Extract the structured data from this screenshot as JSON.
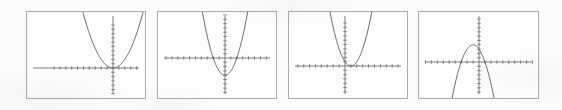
{
  "figure": {
    "caption": "",
    "background_color": "#fbfbfa",
    "panel_border_color": "#a9a9a9",
    "panel_fill_color": "#fdfdfc",
    "axis_color": "#6d6d6d",
    "curve_color": "#5a5a5a",
    "panel_count": 4
  },
  "chart_data": [
    {
      "type": "line",
      "title": "",
      "subtitle": "",
      "xlabel": "",
      "ylabel": "",
      "legend": [],
      "annotations": [],
      "grid": false,
      "axes": {
        "x_axis": true,
        "y_axis": true,
        "ticks": true,
        "tick_labels": false
      },
      "xlim": [
        -10,
        10
      ],
      "ylim": [
        -10,
        10
      ],
      "axis_origin_px": {
        "x": 86,
        "y": 56
      },
      "panel_rect_px": {
        "x": 26,
        "y": 11,
        "width": 120,
        "height": 88
      },
      "x_tick_count": 20,
      "y_tick_count": 20,
      "equation": "y = 0.5x^2",
      "vertex": [
        0,
        0
      ],
      "opens": "up",
      "leading_coefficient": 0.5,
      "x_intercepts": [
        0
      ],
      "y_intercept": 0,
      "x": [
        -4.4,
        -4,
        -3.5,
        -3,
        -2.5,
        -2,
        -1.5,
        -1,
        -0.5,
        0,
        0.5,
        1,
        1.5,
        2,
        2.5,
        3,
        3.5,
        4,
        4.4
      ],
      "values": [
        9.68,
        8,
        6.13,
        4.5,
        3.13,
        2,
        1.13,
        0.5,
        0.13,
        0,
        0.13,
        0.5,
        1.13,
        2,
        3.13,
        4.5,
        6.13,
        8,
        9.68
      ]
    },
    {
      "type": "line",
      "title": "",
      "subtitle": "",
      "xlabel": "",
      "ylabel": "",
      "legend": [],
      "annotations": [],
      "grid": false,
      "axes": {
        "x_axis": true,
        "y_axis": true,
        "ticks": true,
        "tick_labels": false
      },
      "xlim": [
        -10,
        10
      ],
      "ylim": [
        -10,
        10
      ],
      "axis_origin_px": {
        "x": 67,
        "y": 46
      },
      "panel_rect_px": {
        "x": 157,
        "y": 11,
        "width": 120,
        "height": 88
      },
      "x_tick_count": 20,
      "y_tick_count": 20,
      "equation": "y = x^2 - 4",
      "vertex": [
        0,
        -4
      ],
      "opens": "up",
      "leading_coefficient": 1,
      "x_intercepts": [
        -2,
        2
      ],
      "y_intercept": -4,
      "x": [
        -3.2,
        -3,
        -2.5,
        -2,
        -1.5,
        -1,
        -0.5,
        0,
        0.5,
        1,
        1.5,
        2,
        2.5,
        3,
        3.2
      ],
      "values": [
        6.24,
        5,
        2.25,
        0,
        -1.75,
        -3,
        -3.75,
        -4,
        -3.75,
        -3,
        -1.75,
        0,
        2.25,
        5,
        6.24
      ]
    },
    {
      "type": "line",
      "title": "",
      "subtitle": "",
      "xlabel": "",
      "ylabel": "",
      "legend": [],
      "annotations": [],
      "grid": false,
      "axes": {
        "x_axis": true,
        "y_axis": true,
        "ticks": true,
        "tick_labels": false
      },
      "xlim": [
        -10,
        10
      ],
      "ylim": [
        -10,
        10
      ],
      "axis_origin_px": {
        "x": 56,
        "y": 54
      },
      "panel_rect_px": {
        "x": 288,
        "y": 11,
        "width": 120,
        "height": 88
      },
      "x_tick_count": 20,
      "y_tick_count": 20,
      "equation": "y = (x - 1)^2",
      "vertex": [
        1,
        0
      ],
      "opens": "up",
      "leading_coefficient": 1,
      "x_intercepts": [
        1
      ],
      "y_intercept": 1,
      "x": [
        -1.8,
        -1.5,
        -1,
        -0.5,
        0,
        0.5,
        1,
        1.5,
        2,
        2.5,
        3,
        3.5,
        3.8
      ],
      "values": [
        7.84,
        6.25,
        4,
        2.25,
        1,
        0.25,
        0,
        0.25,
        1,
        2.25,
        4,
        6.25,
        7.84
      ]
    },
    {
      "type": "line",
      "title": "",
      "subtitle": "",
      "xlabel": "",
      "ylabel": "",
      "legend": [],
      "annotations": [],
      "grid": false,
      "axes": {
        "x_axis": true,
        "y_axis": true,
        "ticks": true,
        "tick_labels": false
      },
      "xlim": [
        -10,
        10
      ],
      "ylim": [
        -10,
        10
      ],
      "axis_origin_px": {
        "x": 60,
        "y": 50
      },
      "panel_rect_px": {
        "x": 418,
        "y": 11,
        "width": 121,
        "height": 88
      },
      "x_tick_count": 20,
      "y_tick_count": 20,
      "equation": "y = -(x + 1)^2 + 4",
      "vertex": [
        -1,
        4
      ],
      "opens": "down",
      "leading_coefficient": -1,
      "x_intercepts": [
        -3,
        1
      ],
      "y_intercept": 3,
      "x": [
        -3.9,
        -3.5,
        -3,
        -2.5,
        -2,
        -1.5,
        -1,
        -0.5,
        0,
        0.5,
        1,
        1.5,
        2,
        2.4
      ],
      "values": [
        -4.41,
        -2.25,
        0,
        1.75,
        3,
        3.75,
        4,
        3.75,
        3,
        1.75,
        0,
        -2.25,
        -5,
        -7.96
      ]
    }
  ]
}
